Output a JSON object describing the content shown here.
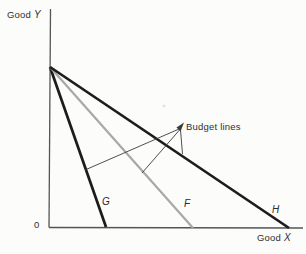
{
  "figure": {
    "axis_y_label": {
      "prefix": "Good ",
      "var": "Y"
    },
    "axis_x_label": {
      "prefix": "Good ",
      "var": "X"
    },
    "origin_label": "0",
    "annotation": "Budget lines",
    "line_labels": {
      "g": "G",
      "f": "F",
      "h": "H"
    }
  },
  "colors": {
    "background": "#fcfcfa",
    "budget_line_dark": "#1c1c1c",
    "budget_line_gray": "#a8a8a8",
    "axis": "#555555",
    "leader": "#3c3c3c",
    "text": "#2e2e2e",
    "speck": "#c9c9c9"
  },
  "geometry": {
    "y_axis": {
      "x1": 50.5,
      "y1": 9,
      "x2": 49,
      "y2": 227.5
    },
    "x_axis": {
      "x1": 49,
      "y1": 227.5,
      "x2": 303,
      "y2": 228
    },
    "line_g": {
      "x1": 50,
      "y1": 67,
      "x2": 106,
      "y2": 227
    },
    "line_f": {
      "x1": 50,
      "y1": 67,
      "x2": 193,
      "y2": 228
    },
    "line_h": {
      "x1": 50,
      "y1": 67,
      "x2": 289,
      "y2": 228
    },
    "leader_g": {
      "x1": 179,
      "y1": 129,
      "x2": 85,
      "y2": 170
    },
    "leader_f": {
      "x1": 179.5,
      "y1": 130,
      "x2": 142,
      "y2": 173
    },
    "leader_h": {
      "x1": 180.5,
      "y1": 130,
      "x2": 182.5,
      "y2": 154
    },
    "arrowhead_points": "184,122.5 176.5,127.5 180.5,131.5",
    "speck": {
      "cx": 164,
      "cy": 106,
      "r": 1.3
    }
  }
}
